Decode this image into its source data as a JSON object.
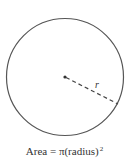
{
  "diagram": {
    "shape": "circle",
    "radius_label": "r",
    "caption": {
      "prefix": "Area = π(radius)",
      "exponent": "2"
    },
    "colors": {
      "stroke": "#555555",
      "text": "#333333",
      "background": "#ffffff"
    }
  }
}
